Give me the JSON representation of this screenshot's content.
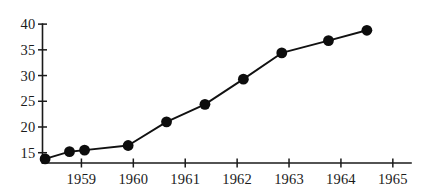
{
  "chart_data": {
    "type": "line",
    "title": "",
    "subtitle": "",
    "xlabel": "",
    "ylabel": "",
    "grid": false,
    "legend": "none",
    "xlim": [
      1958.25,
      1965.35
    ],
    "ylim": [
      13.0,
      40.8
    ],
    "x_tick_labels": [
      "1959",
      "1960",
      "1961",
      "1962",
      "1963",
      "1964",
      "1965"
    ],
    "x_ticks": [
      1959,
      1960,
      1961,
      1962,
      1963,
      1964,
      1965
    ],
    "y_tick_labels": [
      "15",
      "20",
      "25",
      "30",
      "35",
      "40"
    ],
    "y_ticks": [
      15,
      20,
      25,
      30,
      35,
      40
    ],
    "x": [
      1958.3,
      1958.75,
      1959.05,
      1959.9,
      1960.4,
      1960.85,
      1961.4,
      1961.95,
      1962.5,
      1963.05,
      1963.55
    ],
    "values": [
      13.8,
      15.2,
      15.5,
      16.4,
      21.0,
      24.4,
      29.3,
      34.4,
      36.8,
      38.8,
      38.8
    ],
    "series": [
      {
        "name": "series-1",
        "points": [
          {
            "x": 1958.3,
            "y": 13.8
          },
          {
            "x": 1958.77,
            "y": 15.2
          },
          {
            "x": 1959.06,
            "y": 15.5
          },
          {
            "x": 1959.9,
            "y": 16.4
          },
          {
            "x": 1960.64,
            "y": 21.0
          },
          {
            "x": 1961.38,
            "y": 24.4
          },
          {
            "x": 1962.12,
            "y": 29.3
          },
          {
            "x": 1962.86,
            "y": 34.4
          },
          {
            "x": 1963.76,
            "y": 36.8
          },
          {
            "x": 1964.5,
            "y": 38.8
          }
        ]
      }
    ],
    "marker": "filled-circle",
    "marker_color": "#0d0d0d",
    "line_color": "#111111",
    "axis_color": "#1a1a1a",
    "background_color": "#ffffff"
  }
}
